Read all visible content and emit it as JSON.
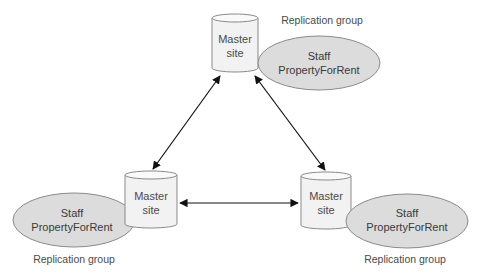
{
  "diagram": {
    "type": "replication-topology",
    "colors": {
      "cylinder_fill": "#f2f2f2",
      "cylinder_stroke": "#8a8a8a",
      "ellipse_fill": "#dcdcdc",
      "ellipse_stroke": "#8a8a8a",
      "arrow": "#111111",
      "text": "#4a4a4a"
    },
    "nodes": [
      {
        "id": "top",
        "site_line1": "Master",
        "site_line2": "site",
        "group_line1": "Staff",
        "group_line2": "PropertyForRent",
        "group_label": "Replication group"
      },
      {
        "id": "bottom-left",
        "site_line1": "Master",
        "site_line2": "site",
        "group_line1": "Staff",
        "group_line2": "PropertyForRent",
        "group_label": "Replication group"
      },
      {
        "id": "bottom-right",
        "site_line1": "Master",
        "site_line2": "site",
        "group_line1": "Staff",
        "group_line2": "PropertyForRent",
        "group_label": "Replication group"
      }
    ],
    "edges": [
      {
        "from": "top",
        "to": "bottom-left",
        "bidirectional": true
      },
      {
        "from": "top",
        "to": "bottom-right",
        "bidirectional": true
      },
      {
        "from": "bottom-left",
        "to": "bottom-right",
        "bidirectional": true
      }
    ]
  }
}
